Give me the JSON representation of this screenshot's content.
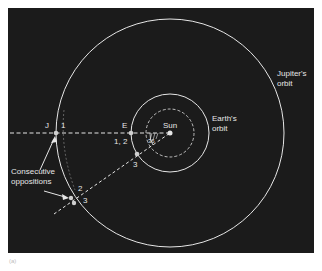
{
  "diagram": {
    "labels": {
      "jupiter_orbit": [
        "Jupiter's",
        "orbit"
      ],
      "earth_orbit": [
        "Earth's",
        "orbit"
      ],
      "sun": "Sun",
      "jupiter": "J",
      "earth": "E",
      "consecutive_oppositions": [
        "Consecutive",
        "oppositions"
      ],
      "j_pos_1": "1",
      "j_pos_2": "2",
      "j_pos_3": "3",
      "e_pos_12": "1, 2",
      "e_pos_3": "3",
      "angle_label": "36"
    },
    "caption": "(a)",
    "colors": {
      "background": "#1b1b1b",
      "lines": "#e6e6e6",
      "page": "#ffffff"
    }
  }
}
